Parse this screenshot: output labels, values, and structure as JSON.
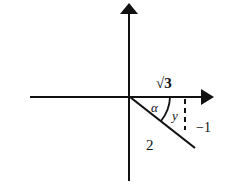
{
  "diagram": {
    "type": "unit-angle-in-coordinate-plane",
    "labels": {
      "horizontal_side": "√3",
      "angle": "α",
      "angle_y": "y",
      "vertical_side": "−1",
      "hypotenuse": "2"
    },
    "colors": {
      "ink": "#111111",
      "background": "#ffffff"
    }
  }
}
